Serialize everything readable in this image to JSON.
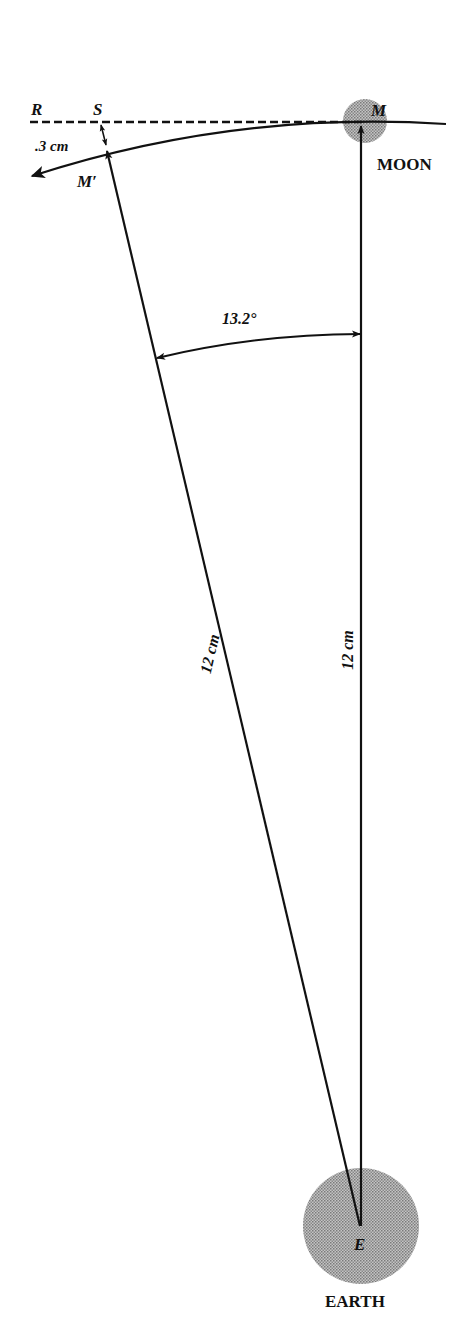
{
  "figure": {
    "type": "geometry-diagram"
  },
  "labels": {
    "point_R": "R",
    "point_S": "S",
    "point_M": "M",
    "point_M_prime": "M′",
    "point_E": "E",
    "moon": "MOON",
    "earth": "EARTH",
    "fall_distance": ".3 cm",
    "angle": "13.2°",
    "radius_left": "12 cm",
    "radius_right": "12 cm"
  },
  "values": {
    "angle_degrees": 13.2,
    "radius_cm": 12,
    "fall_distance_cm": 0.3
  },
  "colors": {
    "ink": "#111111",
    "body_fill": "#a8a8a8",
    "background": "#ffffff"
  }
}
